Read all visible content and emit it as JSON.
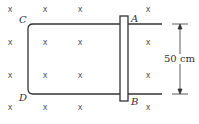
{
  "diagram": {
    "labels": {
      "A": "A",
      "B": "B",
      "C": "C",
      "D": "D"
    },
    "dimension": {
      "label": "50 cm"
    },
    "field_symbol": "x",
    "field_marks": [
      [
        10,
        10
      ],
      [
        45,
        10
      ],
      [
        80,
        10
      ],
      [
        148,
        10
      ],
      [
        10,
        43
      ],
      [
        45,
        43
      ],
      [
        80,
        43
      ],
      [
        148,
        43
      ],
      [
        10,
        76
      ],
      [
        45,
        76
      ],
      [
        80,
        76
      ],
      [
        148,
        76
      ],
      [
        10,
        108
      ],
      [
        45,
        108
      ],
      [
        80,
        108
      ],
      [
        148,
        108
      ]
    ],
    "colors": {
      "line": "#333333",
      "mark": "#555555"
    }
  }
}
